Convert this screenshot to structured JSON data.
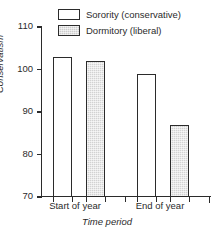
{
  "chart_data": {
    "type": "bar",
    "title": "",
    "xlabel": "Time period",
    "ylabel": "Conservatism",
    "categories": [
      "Start of year",
      "End of year"
    ],
    "series": [
      {
        "name": "Sorority (conservative)",
        "values": [
          103,
          99
        ],
        "color": "#ffffff"
      },
      {
        "name": "Dormitory (liberal)",
        "values": [
          102,
          87
        ],
        "color": "#d2d2d2"
      }
    ],
    "ylim": [
      70,
      110
    ],
    "yticks": [
      70,
      80,
      90,
      100,
      110
    ],
    "ytick_labels": [
      "70",
      "80",
      "90",
      "100",
      "110"
    ],
    "grid": false,
    "legend_position": "top-right"
  },
  "legend": {
    "items": [
      {
        "label": "Sorority (conservative)",
        "swatch": "white"
      },
      {
        "label": "Dormitory (liberal)",
        "swatch": "gray"
      }
    ]
  },
  "axes": {
    "y_title": "Conservatism",
    "x_title": "Time period",
    "y_tick_labels": [
      "110",
      "100",
      "90",
      "80",
      "70"
    ],
    "x_category_labels": [
      "Start of year",
      "End of year"
    ]
  },
  "colors": {
    "line": "#2b2b2b",
    "bar_white": "#ffffff",
    "bar_gray": "#d2d2d2",
    "background": "#ffffff"
  }
}
